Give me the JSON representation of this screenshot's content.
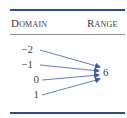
{
  "table": {
    "headers": {
      "domain": "Domain",
      "range": "Range"
    },
    "domain_values": [
      "−2",
      "−1",
      "0",
      "1"
    ],
    "range_values": [
      "6"
    ]
  },
  "mapping": [
    {
      "from": "−2",
      "to": "6"
    },
    {
      "from": "−1",
      "to": "6"
    },
    {
      "from": "0",
      "to": "6"
    },
    {
      "from": "1",
      "to": "6"
    }
  ],
  "colors": {
    "rule": "#2b4a9a",
    "arrow": "#3a5bb0",
    "text": "#3a3a3a"
  }
}
